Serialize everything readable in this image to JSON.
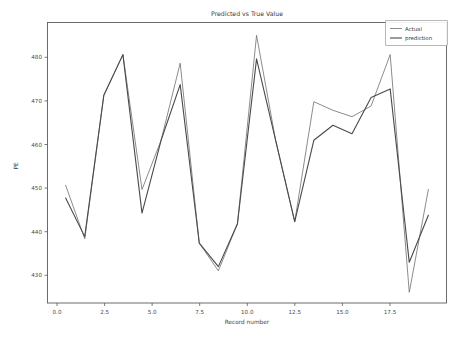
{
  "chart_data": {
    "type": "line",
    "title": "Predicted vs True Value",
    "xlabel": "Record number",
    "ylabel": "PE",
    "grid": false,
    "legend_position": "upper right",
    "xlim": [
      -0.95,
      19.95
    ],
    "ylim": [
      423.0,
      488.5
    ],
    "xticks": [
      0.0,
      2.5,
      5.0,
      7.5,
      10.0,
      12.5,
      15.0,
      17.5
    ],
    "xticklabels": [
      "0.0",
      "2.5",
      "5.0",
      "7.5",
      "10.0",
      "12.5",
      "15.0",
      "17.5"
    ],
    "yticks": [
      430,
      440,
      450,
      460,
      470,
      480
    ],
    "yticklabels": [
      "430",
      "440",
      "450",
      "460",
      "470",
      "480"
    ],
    "x": [
      0,
      1,
      2,
      3,
      4,
      5,
      6,
      7,
      8,
      9,
      10,
      11,
      12,
      13,
      14,
      15,
      16,
      17,
      18,
      19
    ],
    "series": [
      {
        "name": "Actual",
        "color": "#6e6e6e",
        "width": 0.8,
        "values": [
          450.5,
          438.0,
          471.5,
          481.0,
          449.5,
          461.0,
          479.0,
          437.0,
          430.5,
          441.5,
          485.5,
          461.0,
          442.0,
          470.0,
          468.0,
          466.5,
          469.0,
          481.0,
          425.5,
          449.5
        ]
      },
      {
        "name": "prediction",
        "color": "#4a4a4a",
        "width": 1.1,
        "values": [
          447.5,
          438.5,
          471.5,
          481.0,
          444.0,
          461.0,
          474.0,
          437.0,
          431.5,
          441.5,
          480.0,
          461.0,
          442.0,
          461.0,
          464.5,
          462.5,
          471.0,
          473.0,
          432.5,
          443.5
        ]
      }
    ]
  },
  "legend": {
    "entries": [
      {
        "label": "Actual"
      },
      {
        "label": "prediction"
      }
    ]
  }
}
